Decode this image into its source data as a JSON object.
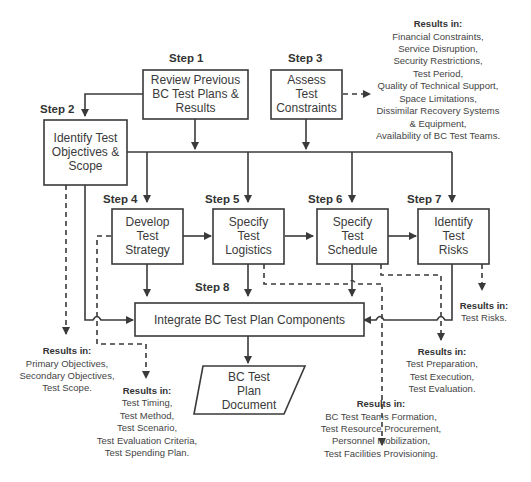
{
  "steps": [
    {
      "id": "step1",
      "label": "Step 1",
      "lines": [
        "Review Previous",
        "BC Test Plans &",
        "Results"
      ]
    },
    {
      "id": "step2",
      "label": "Step 2",
      "lines": [
        "Identify Test",
        "Objectives &",
        "Scope"
      ]
    },
    {
      "id": "step3",
      "label": "Step 3",
      "lines": [
        "Assess",
        "Test",
        "Constraints"
      ]
    },
    {
      "id": "step4",
      "label": "Step 4",
      "lines": [
        "Develop",
        "Test",
        "Strategy"
      ]
    },
    {
      "id": "step5",
      "label": "Step 5",
      "lines": [
        "Specify",
        "Test",
        "Logistics"
      ]
    },
    {
      "id": "step6",
      "label": "Step 6",
      "lines": [
        "Specify",
        "Test",
        "Schedule"
      ]
    },
    {
      "id": "step7",
      "label": "Step 7",
      "lines": [
        "Identify",
        "Test",
        "Risks"
      ]
    },
    {
      "id": "step8",
      "label": "Step 8",
      "lines": [
        "Integrate BC Test Plan Components"
      ]
    }
  ],
  "document": {
    "lines": [
      "BC Test",
      "Plan",
      "Document"
    ]
  },
  "results": {
    "step3": {
      "heading": "Results in:",
      "lines": [
        "Financial Constraints,",
        "Service Disruption,",
        "Security Restrictions,",
        "Test Period,",
        "Quality of Technical Support,",
        "Space Limitations,",
        "Dissimilar Recovery Systems",
        "& Equipment,",
        "Availability of BC Test Teams."
      ]
    },
    "step2": {
      "heading": "Results in:",
      "lines": [
        "Primary Objectives,",
        "Secondary Objectives,",
        "Test Scope."
      ]
    },
    "step4": {
      "heading": "Results in:",
      "lines": [
        "Test Timing,",
        "Test Method,",
        "Test Scenario,",
        "Test Evaluation Criteria,",
        "Test Spending Plan."
      ]
    },
    "step5": {
      "heading": "Results in:",
      "lines": [
        "BC Test Teams Formation,",
        "Test Resource Procurement,",
        "Personnel Mobilization,",
        "Test Facilities Provisioning."
      ]
    },
    "step6": {
      "heading": "Results in:",
      "lines": [
        "Test Preparation,",
        "Test Execution,",
        "Test Evaluation."
      ]
    },
    "step7": {
      "heading": "Results in:",
      "lines": [
        "Test Risks."
      ]
    }
  }
}
